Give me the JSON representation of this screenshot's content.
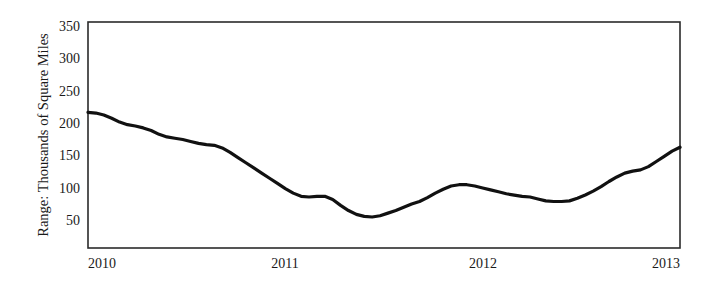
{
  "chart_data": {
    "type": "line",
    "title": "",
    "subtitle": "",
    "xlabel": "",
    "ylabel": "Range: Thousands of Square Miles",
    "xlim": [
      2010.0,
      2013.0
    ],
    "ylim": [
      0,
      350
    ],
    "grid": false,
    "legend": null,
    "x_tick_labels": [
      "2010",
      "2011",
      "2012",
      "2013"
    ],
    "x_ticks": [
      2010,
      2011,
      2012,
      2013
    ],
    "y_tick_labels": [
      "50",
      "100",
      "150",
      "200",
      "250",
      "300",
      "350"
    ],
    "y_ticks": [
      50,
      100,
      150,
      200,
      250,
      300,
      350
    ],
    "series": [
      {
        "name": "Range",
        "color": "#111111",
        "line_width": 3.2,
        "x": [
          2010.0,
          2010.04,
          2010.08,
          2010.12,
          2010.16,
          2010.2,
          2010.24,
          2010.28,
          2010.32,
          2010.36,
          2010.4,
          2010.44,
          2010.48,
          2010.52,
          2010.56,
          2010.6,
          2010.64,
          2010.68,
          2010.72,
          2010.76,
          2010.8,
          2010.84,
          2010.88,
          2010.92,
          2010.96,
          2011.0,
          2011.04,
          2011.08,
          2011.12,
          2011.16,
          2011.2,
          2011.24,
          2011.28,
          2011.32,
          2011.36,
          2011.4,
          2011.44,
          2011.48,
          2011.52,
          2011.56,
          2011.6,
          2011.64,
          2011.68,
          2011.72,
          2011.76,
          2011.8,
          2011.84,
          2011.88,
          2011.92,
          2011.96,
          2012.0,
          2012.04,
          2012.08,
          2012.12,
          2012.16,
          2012.2,
          2012.24,
          2012.28,
          2012.32,
          2012.36,
          2012.4,
          2012.44,
          2012.48,
          2012.52,
          2012.56,
          2012.6,
          2012.64,
          2012.68,
          2012.72,
          2012.76,
          2012.8,
          2012.84,
          2012.88,
          2012.92,
          2012.96,
          2013.0
        ],
        "y": [
          210,
          209,
          206,
          201,
          195,
          191,
          189,
          186,
          182,
          176,
          172,
          170,
          168,
          165,
          162,
          160,
          159,
          155,
          148,
          140,
          132,
          124,
          116,
          108,
          100,
          92,
          85,
          80,
          79,
          80,
          80,
          75,
          66,
          58,
          52,
          49,
          48,
          50,
          54,
          58,
          63,
          68,
          72,
          78,
          85,
          91,
          96,
          98,
          98,
          96,
          93,
          90,
          87,
          84,
          82,
          80,
          79,
          76,
          73,
          72,
          72,
          73,
          77,
          82,
          88,
          95,
          103,
          110,
          116,
          119,
          121,
          126,
          134,
          142,
          150,
          156
        ]
      }
    ],
    "annotations": []
  },
  "axis": {
    "ylabel": "Range: Thousands of Square Miles",
    "x_labels": [
      "2010",
      "2011",
      "2012",
      "2013"
    ],
    "y_labels": [
      "350",
      "300",
      "250",
      "200",
      "150",
      "100",
      "50"
    ]
  },
  "style": {
    "line_color": "#111111",
    "axis_color": "#2b2b2b",
    "background": "#ffffff"
  }
}
